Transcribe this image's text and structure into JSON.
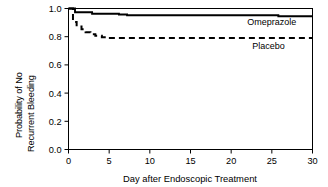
{
  "chart_data": {
    "type": "line",
    "subtype": "kaplan-meier-step",
    "title": "",
    "xlabel": "Day after Endoscopic Treatment",
    "ylabel": "Probability of No Recurrent Bleeding",
    "ylabel_line1": "Probability of No",
    "ylabel_line2": "Recurrent Bleeding",
    "xlim": [
      0,
      30
    ],
    "ylim": [
      0.0,
      1.0
    ],
    "xticks": [
      0,
      5,
      10,
      15,
      20,
      25,
      30
    ],
    "xticklabels": [
      "0",
      "5",
      "10",
      "15",
      "20",
      "25",
      "30"
    ],
    "yticks": [
      0.0,
      0.2,
      0.4,
      0.6,
      0.8,
      1.0
    ],
    "yticklabels": [
      "0.0",
      "0.2",
      "0.4",
      "0.6",
      "0.8",
      "1.0"
    ],
    "grid": false,
    "legend_position": "inline-right",
    "frame": "box",
    "colors": {
      "omeprazole": "#000000",
      "placebo": "#000000",
      "axis": "#000000",
      "background": "#ffffff"
    },
    "series": [
      {
        "name": "Omeprazole",
        "style": "solid",
        "label_x": 25.0,
        "label_y": 0.885,
        "x": [
          0,
          0.8,
          0.8,
          2.9,
          2.9,
          6.2,
          6.2,
          7.2,
          7.2,
          25.8,
          25.8,
          30
        ],
        "y": [
          1.0,
          1.0,
          0.973,
          0.973,
          0.963,
          0.963,
          0.957,
          0.957,
          0.952,
          0.952,
          0.945,
          0.945
        ]
      },
      {
        "name": "Placebo",
        "style": "dashed",
        "label_x": 24.6,
        "label_y": 0.715,
        "x": [
          0,
          0.55,
          0.55,
          1.0,
          1.0,
          1.6,
          1.6,
          2.1,
          2.1,
          2.7,
          2.7,
          3.3,
          3.3,
          4.1,
          4.1,
          4.9,
          4.9,
          30
        ],
        "y": [
          1.0,
          1.0,
          0.905,
          0.905,
          0.872,
          0.872,
          0.852,
          0.852,
          0.832,
          0.832,
          0.818,
          0.818,
          0.806,
          0.806,
          0.796,
          0.796,
          0.79,
          0.79
        ]
      }
    ]
  },
  "axes_labels": {
    "x_title": "Day after Endoscopic Treatment",
    "y_title_line1": "Probability of No",
    "y_title_line2": "Recurrent Bleeding"
  },
  "series_labels": {
    "omeprazole": "Omeprazole",
    "placebo": "Placebo"
  }
}
